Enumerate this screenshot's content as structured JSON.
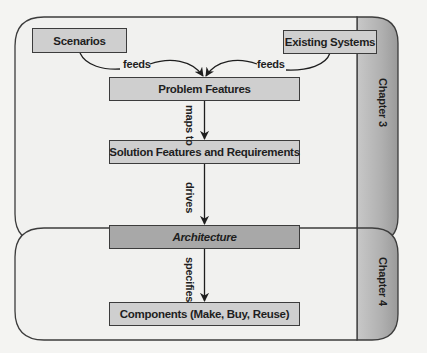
{
  "diagram": {
    "groups": [
      {
        "id": "chapter3",
        "label": "Chapter 3"
      },
      {
        "id": "chapter4",
        "label": "Chapter 4"
      }
    ],
    "nodes": {
      "scenarios": "Scenarios",
      "existing_systems": "Existing Systems",
      "problem_features": "Problem Features",
      "solution_features": "Solution Features and Requirements",
      "architecture": "Architecture",
      "components": "Components (Make, Buy, Reuse)"
    },
    "edges": {
      "scenarios_to_problem": "feeds",
      "existing_to_problem": "feeds",
      "problem_to_solution": "maps to",
      "solution_to_architecture": "drives",
      "architecture_to_components": "specifies"
    },
    "colors": {
      "box_fill": "#cfcfcf",
      "highlight_fill": "#a8a8a8",
      "container_fill": "#f1f1ef",
      "tab_fill": "#b4b4b4",
      "stroke": "#3c3c3c"
    }
  }
}
